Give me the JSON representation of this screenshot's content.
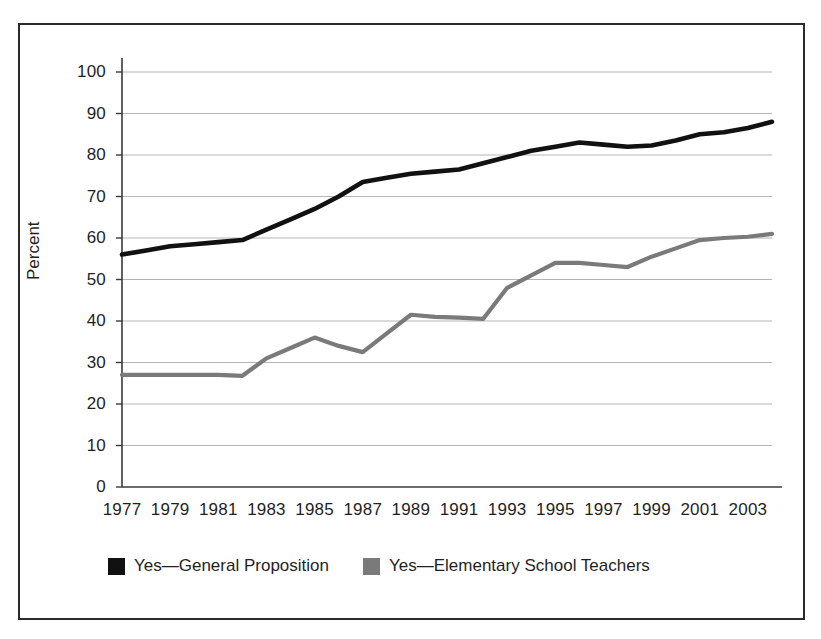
{
  "chart_data": {
    "type": "line",
    "title": "",
    "subtitle": "",
    "xlabel": "",
    "ylabel": "Percent",
    "x": [
      1977,
      1978,
      1979,
      1980,
      1981,
      1982,
      1983,
      1984,
      1985,
      1986,
      1987,
      1988,
      1989,
      1990,
      1991,
      1992,
      1993,
      1994,
      1995,
      1996,
      1997,
      1998,
      1999,
      2000,
      2001,
      2002,
      2003,
      2004
    ],
    "xtick_labels": [
      "1977",
      "1979",
      "1981",
      "1983",
      "1985",
      "1987",
      "1989",
      "1991",
      "1993",
      "1995",
      "1997",
      "1999",
      "2001",
      "2003"
    ],
    "xtick_values": [
      1977,
      1979,
      1981,
      1983,
      1985,
      1987,
      1989,
      1991,
      1993,
      1995,
      1997,
      1999,
      2001,
      2003
    ],
    "ytick_labels": [
      "0",
      "10",
      "20",
      "30",
      "40",
      "50",
      "60",
      "70",
      "80",
      "90",
      "100"
    ],
    "ytick_values": [
      0,
      10,
      20,
      30,
      40,
      50,
      60,
      70,
      80,
      90,
      100
    ],
    "ylim": [
      0,
      100
    ],
    "xlim": [
      1977,
      2004
    ],
    "grid": true,
    "grid_axis": "y",
    "legend_position": "bottom-left",
    "series": [
      {
        "name": "Yes—General Proposition",
        "color": "#111111",
        "values": [
          56.0,
          57.0,
          58.0,
          58.5,
          59.0,
          59.5,
          62.0,
          64.5,
          67.0,
          70.0,
          73.5,
          74.5,
          75.5,
          76.0,
          76.5,
          78.0,
          79.5,
          81.0,
          82.0,
          83.0,
          82.5,
          82.0,
          82.3,
          83.5,
          85.0,
          85.5,
          86.5,
          88.0
        ]
      },
      {
        "name": "Yes—Elementary School Teachers",
        "color": "#7a7a7a",
        "values": [
          27.0,
          27.0,
          27.0,
          27.0,
          27.0,
          26.8,
          31.0,
          33.5,
          36.0,
          34.0,
          32.5,
          37.0,
          41.5,
          41.0,
          40.8,
          40.5,
          48.0,
          51.0,
          54.0,
          54.0,
          53.5,
          53.0,
          55.5,
          57.5,
          59.5,
          60.0,
          60.3,
          61.0
        ]
      }
    ]
  },
  "legend": {
    "entries": [
      {
        "label": "Yes—General Proposition",
        "color": "#111111"
      },
      {
        "label": "Yes—Elementary School Teachers",
        "color": "#7a7a7a"
      }
    ]
  },
  "axes": {
    "y_title": "Percent"
  },
  "style": {
    "frame_color": "#2b2b2b",
    "grid_color": "#b5b5b5",
    "axis_color": "#3a3a3a",
    "background": "#ffffff"
  }
}
